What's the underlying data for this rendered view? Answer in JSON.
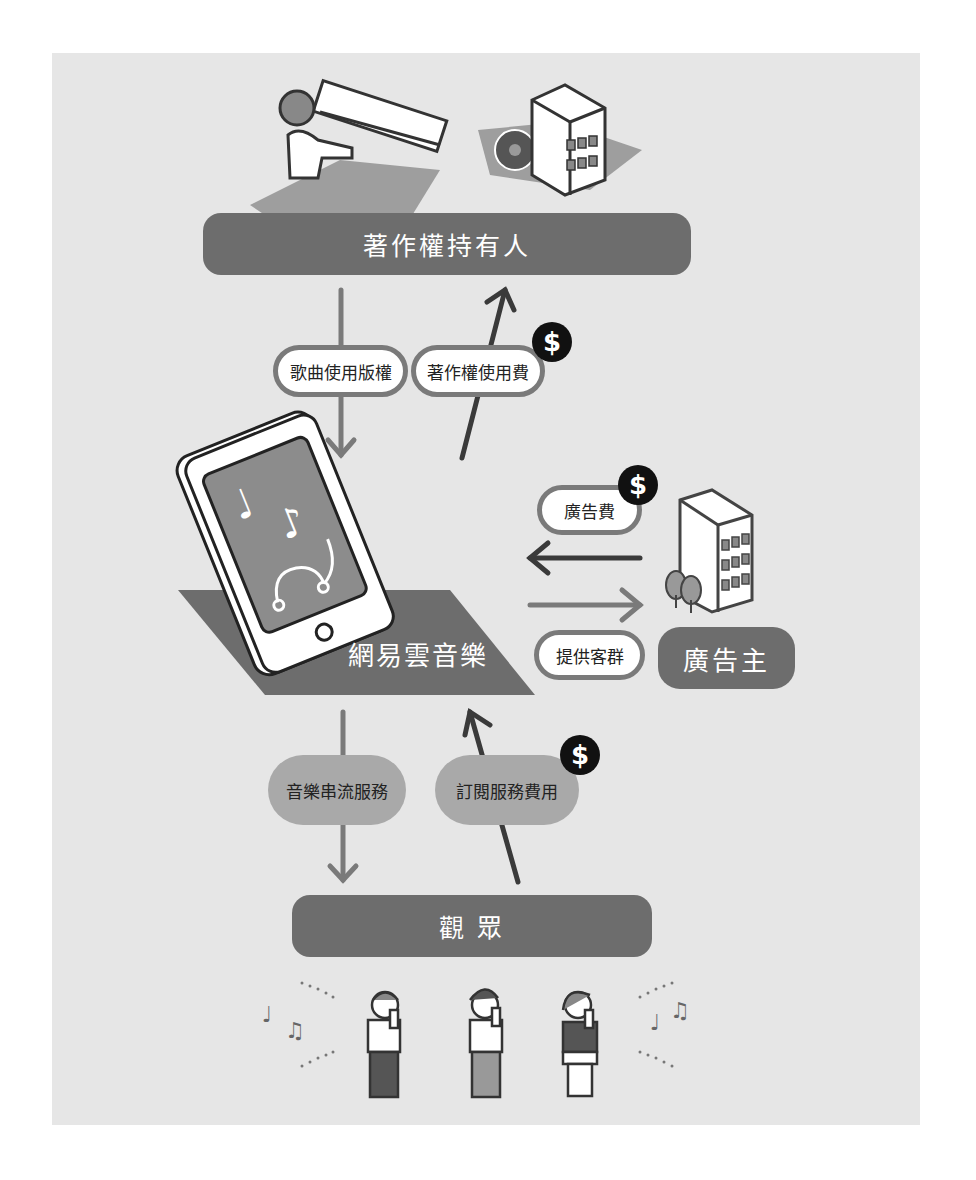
{
  "nodes": {
    "copyright_holder": "著作權持有人",
    "platform": "網易雲音樂",
    "advertiser": "廣告主",
    "audience": "觀 眾"
  },
  "flows": {
    "song_license": "歌曲使用版權",
    "royalty_fee": "著作權使用費",
    "ad_fee": "廣告費",
    "provide_audience": "提供客群",
    "streaming_service": "音樂串流服務",
    "subscription_fee": "訂閱服務費用"
  },
  "icons": {
    "money": "$"
  },
  "colors": {
    "panel_bg": "#e6e6e6",
    "node_fill": "#6d6d6d",
    "arrow_gray": "#7a7a7a",
    "arrow_dark": "#3a3a3a",
    "badge": "#111111"
  }
}
